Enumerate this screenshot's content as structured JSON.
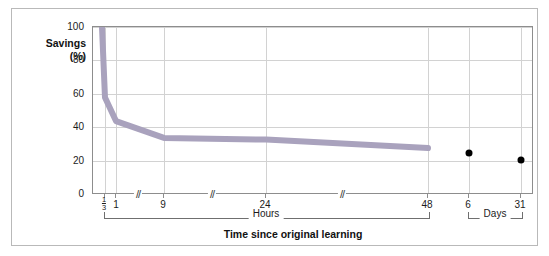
{
  "figure": {
    "y_axis": {
      "label_line1": "Savings",
      "label_line2": "(%)",
      "ticks": [
        "100",
        "80",
        "60",
        "40",
        "20",
        "0"
      ]
    },
    "x_axis": {
      "title": "Time since original learning",
      "tick_labels": [
        "1/3",
        "1",
        "9",
        "24",
        "48",
        "6",
        "31"
      ],
      "fraction_tick": {
        "numerator": "1",
        "denominator": "3"
      },
      "group_hours_label": "Hours",
      "group_days_label": "Days",
      "break_mark": "//"
    },
    "colors": {
      "curve": "#a9a2bd",
      "dot": "#000000",
      "grid": "#d2d2d2",
      "axis": "#8d8d8d",
      "frame": "#b9b9b9",
      "text": "#1c1c1c",
      "background": "#ffffff"
    }
  },
  "chart_data": {
    "type": "line",
    "title": "",
    "xlabel": "Time since original learning",
    "ylabel": "Savings (%)",
    "ylim": [
      0,
      100
    ],
    "yticks": [
      0,
      20,
      40,
      60,
      80,
      100
    ],
    "grid": true,
    "legend": "none",
    "x_scale": "non-linear (broken axis)",
    "x_tick_labels": [
      "1/3",
      "1",
      "9",
      "24",
      "48",
      "6",
      "31"
    ],
    "x_tick_units": [
      "hours",
      "hours",
      "hours",
      "hours",
      "hours",
      "days",
      "days"
    ],
    "series": [
      {
        "name": "Retention curve (savings)",
        "type": "line",
        "x": [
          "0",
          "1/3",
          "1",
          "9",
          "24",
          "48"
        ],
        "x_units": [
          "hours",
          "hours",
          "hours",
          "hours",
          "hours",
          "hours"
        ],
        "values": [
          100,
          58,
          44,
          34,
          33,
          28
        ]
      },
      {
        "name": "Long-delay points",
        "type": "scatter",
        "x": [
          "6",
          "31"
        ],
        "x_units": [
          "days",
          "days"
        ],
        "values": [
          25,
          21
        ]
      }
    ]
  }
}
